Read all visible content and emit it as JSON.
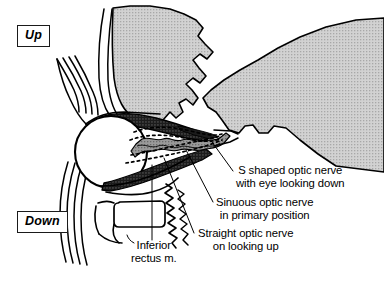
{
  "figure": {
    "type": "anatomical-line-diagram",
    "width": 384,
    "height": 283,
    "background_color": "#ffffff",
    "ink_color": "#000000",
    "bone_fill_color": "#cccccc",
    "muscle_fill_color": "#1a1a1a",
    "nerve_fill_color": "#8c8c8c"
  },
  "orientation": {
    "up_label": "Up",
    "down_label": "Down"
  },
  "callouts": [
    {
      "name": "s-shaped-optic-nerve",
      "line1": "S shaped optic nerve",
      "line2": "with eye looking down"
    },
    {
      "name": "sinuous-optic-nerve",
      "line1": "Sinuous optic nerve",
      "line2": "in primary position"
    },
    {
      "name": "straight-optic-nerve",
      "line1": "Straight optic nerve",
      "line2": "on looking up"
    },
    {
      "name": "inferior-rectus-muscle",
      "line1": "Inferior",
      "line2": "rectus m."
    }
  ],
  "structures": [
    {
      "name": "eyeball",
      "style": "white circle with black outline"
    },
    {
      "name": "superior-rectus-muscle",
      "style": "dark stippled wedge above globe"
    },
    {
      "name": "inferior-rectus-muscle",
      "style": "dark stippled band below globe"
    },
    {
      "name": "optic-nerve-sinuous",
      "style": "grey irregular band from globe to apex"
    },
    {
      "name": "optic-nerve-s-shaped",
      "style": "upper dotted path"
    },
    {
      "name": "optic-nerve-straight",
      "style": "lower dotted path"
    },
    {
      "name": "frontal-and-ethmoid-bone",
      "style": "grey stippled lobed mass, superior"
    },
    {
      "name": "sphenoid-cranial-bone",
      "style": "grey stippled mass, posterior right"
    },
    {
      "name": "eyelid-contours",
      "style": "stacked thin curves, anterior left"
    },
    {
      "name": "maxillary-sinus",
      "style": "rounded rectangle, inferior"
    },
    {
      "name": "inferior-oblique-squiggle",
      "style": "wavy vertical line"
    }
  ]
}
